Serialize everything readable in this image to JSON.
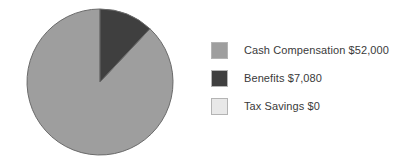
{
  "chart_data": {
    "type": "pie",
    "title": "",
    "labels": [
      "Cash Compensation",
      "Benefits",
      "Tax Savings"
    ],
    "values": [
      52000,
      7080,
      0
    ],
    "value_labels": [
      "$52,000",
      "$7,080",
      "$0"
    ],
    "legend_entries": [
      "Cash Compensation $52,000",
      "Benefits $7,080",
      "Tax Savings $0"
    ],
    "colors": [
      "#9e9e9e",
      "#3f3f3f",
      "#e8e8e8"
    ],
    "percentages": [
      88.0,
      12.0,
      0.0
    ],
    "start_angle_deg": 0,
    "direction": "counterclockwise",
    "legend_position": "right",
    "grid": false,
    "background_color": "#ffffff",
    "stroke_color": "#6b6b6b",
    "text_color": "#3a3a3a"
  },
  "legend": {
    "items": [
      {
        "label": "Cash Compensation $52,000",
        "color": "#9e9e9e",
        "swatch_name": "swatch-cash-compensation"
      },
      {
        "label": "Benefits $7,080",
        "color": "#3f3f3f",
        "swatch_name": "swatch-benefits"
      },
      {
        "label": "Tax Savings $0",
        "color": "#e8e8e8",
        "swatch_name": "swatch-tax-savings"
      }
    ]
  },
  "pie": {
    "center_x": 100,
    "center_y": 82,
    "radius": 73
  }
}
